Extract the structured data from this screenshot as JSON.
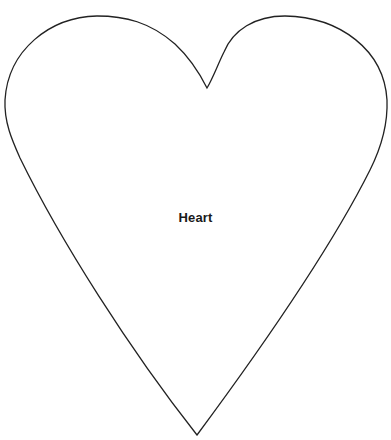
{
  "shape": {
    "type": "heart",
    "label": "Heart",
    "stroke_color": "#222222",
    "fill_color": "#ffffff"
  }
}
